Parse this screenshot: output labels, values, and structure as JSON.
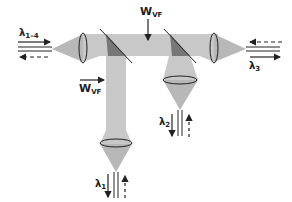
{
  "diagram": {
    "type": "optical-wavelength-demultiplexer",
    "labels": {
      "input": {
        "symbol": "λ",
        "sub": "1–4"
      },
      "wvf_top": {
        "symbol": "W",
        "sub": "VF"
      },
      "wvf_left": {
        "symbol": "W",
        "sub": "VF"
      },
      "output_right": {
        "symbol": "λ",
        "sub": "3"
      },
      "output_middle": {
        "symbol": "λ",
        "sub": "2"
      },
      "output_bottom": {
        "symbol": "λ",
        "sub": "1"
      }
    },
    "colors": {
      "beam": "#c8c8c8",
      "beam_dark": "#9a9a9a",
      "filter": "#6f6f6f",
      "line": "#222222"
    }
  }
}
